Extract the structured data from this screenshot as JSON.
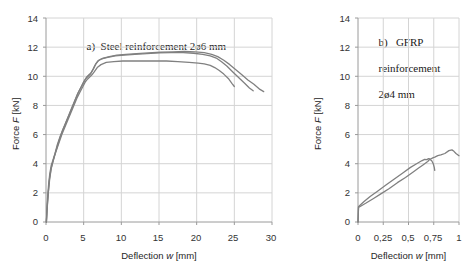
{
  "figure": {
    "width": 469,
    "height": 275,
    "background": "#ffffff",
    "series_color": "#808080",
    "grid_color": "#d4d4d4",
    "axis_color": "#9a9a9a",
    "text_color": "#262626"
  },
  "panel_a": {
    "title": "a)  Steel reinforcement 2ø6 mm",
    "title_line1": "a)  Steel reinforcement 2ø6 mm",
    "ylabel": "Force F [kN]",
    "ylabel_prefix": "Force ",
    "ylabel_var": "F",
    "ylabel_suffix": " [kN]",
    "xlabel": "Deflection w [mm]",
    "xlabel_prefix": "Deflection ",
    "xlabel_var": "w",
    "xlabel_suffix": " [mm]",
    "yticks": [
      "0",
      "2",
      "4",
      "6",
      "8",
      "10",
      "12",
      "14"
    ],
    "xticks": [
      "0",
      "5",
      "10",
      "15",
      "20",
      "25",
      "30"
    ]
  },
  "panel_b": {
    "title_line1": "b)   GFRP",
    "title_line2": "reinforcement",
    "title_line3": "2ø4 mm",
    "ylabel": "Force F [kN]",
    "ylabel_prefix": "Force ",
    "ylabel_var": "F",
    "ylabel_suffix": " [kN]",
    "xlabel": "Deflection w [mm]",
    "xlabel_prefix": "Deflection ",
    "xlabel_var": "w",
    "xlabel_suffix": " [mm]",
    "yticks": [
      "0",
      "2",
      "4",
      "6",
      "8",
      "10",
      "12",
      "14"
    ],
    "xticks": [
      "0",
      "0,25",
      "0,5",
      "0,75",
      "1"
    ]
  },
  "chart_data": [
    {
      "type": "line",
      "panel": "a",
      "title": "a)  Steel reinforcement 2ø6 mm",
      "xlabel": "Deflection w [mm]",
      "ylabel": "Force F [kN]",
      "xlim": [
        0,
        30
      ],
      "ylim": [
        0,
        14
      ],
      "xticks": [
        0,
        5,
        10,
        15,
        20,
        25,
        30
      ],
      "yticks": [
        0,
        2,
        4,
        6,
        8,
        10,
        12,
        14
      ],
      "grid": true,
      "legend": "none",
      "series": [
        {
          "name": "specimen-1",
          "x": [
            0.05,
            0.12,
            0.2,
            0.35,
            0.5,
            0.7,
            0.9,
            1.2,
            1.5,
            1.9,
            2.3,
            2.7,
            3.1,
            3.5,
            3.9,
            4.3,
            4.7,
            5.1,
            5.4,
            5.7,
            6.0,
            6.3,
            6.6,
            7.0,
            7.6,
            8.4,
            9.4,
            10.6,
            12.0,
            13.6,
            15.2,
            16.8,
            18.4,
            19.8,
            21.0,
            22.0,
            22.8,
            23.6,
            24.4,
            25.2,
            26.0,
            26.8,
            27.6,
            28.4,
            28.9
          ],
          "y": [
            0.0,
            0.8,
            1.6,
            2.6,
            3.3,
            3.9,
            4.2,
            4.7,
            5.3,
            5.9,
            6.4,
            6.9,
            7.4,
            7.9,
            8.4,
            8.9,
            9.3,
            9.7,
            9.95,
            10.1,
            10.25,
            10.5,
            10.85,
            11.1,
            11.25,
            11.35,
            11.45,
            11.5,
            11.55,
            11.6,
            11.65,
            11.68,
            11.7,
            11.68,
            11.62,
            11.5,
            11.35,
            11.1,
            10.8,
            10.45,
            10.1,
            9.75,
            9.45,
            9.1,
            8.95
          ]
        },
        {
          "name": "specimen-2",
          "x": [
            0.05,
            0.15,
            0.3,
            0.45,
            0.65,
            0.85,
            1.1,
            1.45,
            1.8,
            2.2,
            2.6,
            3.0,
            3.4,
            3.8,
            4.2,
            4.6,
            5.0,
            5.3,
            5.6,
            5.9,
            6.2,
            6.5,
            6.9,
            7.4,
            8.2,
            9.2,
            10.4,
            11.8,
            13.4,
            15.0,
            16.6,
            18.2,
            19.6,
            20.8,
            21.8,
            22.6,
            23.3,
            24.0,
            24.8,
            25.6,
            26.4,
            27.0,
            27.5
          ],
          "y": [
            0.0,
            1.0,
            2.0,
            2.9,
            3.6,
            4.0,
            4.5,
            5.1,
            5.7,
            6.3,
            6.8,
            7.3,
            7.8,
            8.3,
            8.8,
            9.2,
            9.6,
            9.85,
            10.0,
            10.15,
            10.45,
            10.75,
            11.05,
            11.2,
            11.3,
            11.4,
            11.45,
            11.5,
            11.55,
            11.6,
            11.62,
            11.62,
            11.58,
            11.5,
            11.4,
            11.25,
            11.0,
            10.7,
            10.3,
            9.9,
            9.5,
            9.2,
            9.0
          ]
        },
        {
          "name": "specimen-3",
          "x": [
            0.05,
            0.18,
            0.32,
            0.5,
            0.7,
            0.95,
            1.3,
            1.7,
            2.1,
            2.5,
            2.9,
            3.3,
            3.7,
            4.1,
            4.5,
            4.9,
            5.2,
            5.5,
            5.8,
            6.1,
            6.4,
            6.8,
            7.3,
            8.0,
            9.0,
            10.2,
            11.5,
            13.0,
            14.5,
            16.0,
            17.5,
            19.0,
            20.2,
            21.0,
            21.8,
            22.4,
            23.0,
            23.6,
            24.2,
            24.7,
            25.0
          ],
          "y": [
            0.0,
            1.1,
            2.1,
            3.0,
            3.7,
            4.2,
            4.8,
            5.4,
            6.0,
            6.5,
            7.0,
            7.5,
            8.0,
            8.5,
            8.9,
            9.3,
            9.6,
            9.8,
            9.95,
            10.1,
            10.3,
            10.6,
            10.8,
            10.95,
            11.0,
            11.05,
            11.05,
            11.05,
            11.05,
            11.05,
            11.0,
            10.95,
            10.9,
            10.85,
            10.75,
            10.6,
            10.4,
            10.15,
            9.85,
            9.5,
            9.3
          ]
        }
      ]
    },
    {
      "type": "line",
      "panel": "b",
      "title": "b)   GFRP reinforcement 2ø4 mm",
      "xlabel": "Deflection w [mm]",
      "ylabel": "Force F [kN]",
      "xlim": [
        0,
        1
      ],
      "ylim": [
        0,
        14
      ],
      "xticks": [
        0,
        0.25,
        0.5,
        0.75,
        1
      ],
      "xticklabels": [
        "0",
        "0,25",
        "0,5",
        "0,75",
        "1"
      ],
      "yticks": [
        0,
        2,
        4,
        6,
        8,
        10,
        12,
        14
      ],
      "grid": true,
      "legend": "none",
      "series": [
        {
          "name": "specimen-1",
          "x": [
            0.0,
            0.005,
            0.02,
            0.06,
            0.12,
            0.2,
            0.28,
            0.36,
            0.44,
            0.52,
            0.58,
            0.63,
            0.66,
            0.68,
            0.7,
            0.72,
            0.74,
            0.76,
            0.79,
            0.82,
            0.86,
            0.9,
            0.93,
            0.95,
            0.97,
            1.0
          ],
          "y": [
            0.0,
            1.05,
            1.15,
            1.4,
            1.75,
            2.15,
            2.55,
            2.95,
            3.35,
            3.75,
            4.0,
            4.2,
            4.3,
            4.28,
            4.35,
            4.32,
            4.4,
            4.45,
            4.55,
            4.6,
            4.7,
            4.9,
            4.95,
            4.85,
            4.7,
            4.55
          ]
        },
        {
          "name": "specimen-2",
          "x": [
            0.0,
            0.005,
            0.03,
            0.08,
            0.15,
            0.23,
            0.31,
            0.39,
            0.47,
            0.55,
            0.6,
            0.64,
            0.67,
            0.69,
            0.71,
            0.73,
            0.745,
            0.755,
            0.76
          ],
          "y": [
            0.0,
            1.0,
            1.1,
            1.3,
            1.6,
            1.95,
            2.3,
            2.7,
            3.05,
            3.45,
            3.7,
            3.9,
            4.05,
            4.15,
            4.3,
            4.2,
            4.0,
            3.75,
            3.55
          ]
        }
      ]
    }
  ]
}
